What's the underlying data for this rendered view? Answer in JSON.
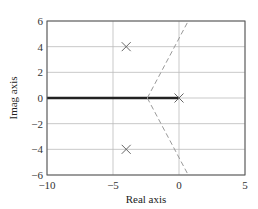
{
  "chart_data": {
    "type": "line",
    "title": "",
    "xlabel": "Real axis",
    "ylabel": "Imag axis",
    "xlim": [
      -10,
      5
    ],
    "ylim": [
      -6,
      6
    ],
    "x_ticks": [
      -10,
      -5,
      0,
      5
    ],
    "x_tick_labels": [
      "−10",
      "−5",
      "0",
      "5"
    ],
    "y_ticks": [
      -6,
      -4,
      -2,
      0,
      2,
      4,
      6
    ],
    "y_tick_labels": [
      "−6",
      "−4",
      "−2",
      "0",
      "2",
      "4",
      "6"
    ],
    "grid": true,
    "legend": null,
    "poles": [
      {
        "x": -4,
        "y": 4,
        "marker": "x"
      },
      {
        "x": -4,
        "y": -4,
        "marker": "x"
      },
      {
        "x": 0,
        "y": 0,
        "marker": "x"
      }
    ],
    "series": [
      {
        "name": "real-axis-locus",
        "style": "solid-bold",
        "color": "#222222",
        "points": [
          [
            -10,
            0
          ],
          [
            0,
            0
          ]
        ]
      },
      {
        "name": "asymptote-upper",
        "style": "dashed",
        "color": "#999999",
        "points": [
          [
            -2.4,
            0
          ],
          [
            0.7,
            6
          ]
        ]
      },
      {
        "name": "asymptote-lower",
        "style": "dashed",
        "color": "#999999",
        "points": [
          [
            -2.4,
            0
          ],
          [
            0.7,
            -6
          ]
        ]
      }
    ]
  },
  "colors": {
    "frame": "#555555",
    "grid": "#bbbbbb",
    "locus": "#222222",
    "asymptote": "#999999",
    "pole": "#666666"
  }
}
